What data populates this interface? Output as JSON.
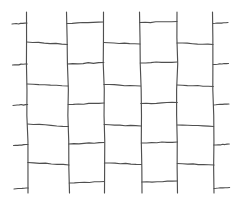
{
  "figure": {
    "width": 239,
    "height": 203,
    "background_color": "#ffffff",
    "ink_color": "#4f4f4f",
    "stroke_width": 1.15,
    "style": "hand-drawn pencil line sketch, no text labels"
  },
  "chart_data": {
    "type": "line",
    "xlabel": "",
    "ylabel": "",
    "xlim": [
      0,
      239
    ],
    "ylim": [
      0,
      203
    ],
    "grid": false,
    "legend": "none",
    "vertical_lines": [
      {
        "id": "v1",
        "x_top": 26.5,
        "x_bottom": 28.0,
        "y_start": 12.0,
        "y_end": 193.0
      },
      {
        "id": "v2",
        "x_top": 66.5,
        "x_bottom": 69.5,
        "y_start": 12.0,
        "y_end": 193.0
      },
      {
        "id": "v3",
        "x_top": 103.5,
        "x_bottom": 104.5,
        "y_start": 12.0,
        "y_end": 193.0
      },
      {
        "id": "v4",
        "x_top": 139.5,
        "x_bottom": 142.0,
        "y_start": 12.0,
        "y_end": 193.0
      },
      {
        "id": "v5",
        "x_top": 177.0,
        "x_bottom": 177.5,
        "y_start": 12.0,
        "y_end": 193.0
      },
      {
        "id": "v6",
        "x_top": 212.5,
        "x_bottom": 214.0,
        "y_start": 12.0,
        "y_end": 193.0
      }
    ],
    "horizontal_rungs": [
      {
        "id": "c1r1",
        "column": 1,
        "phase": "odd",
        "x_start": 26.8,
        "y_start": 42.0,
        "x_end": 67.5,
        "y_end": 44.5
      },
      {
        "id": "c1r2",
        "column": 1,
        "phase": "odd",
        "x_start": 27.2,
        "y_start": 84.0,
        "x_end": 68.0,
        "y_end": 86.0
      },
      {
        "id": "c1r3",
        "column": 1,
        "phase": "odd",
        "x_start": 27.5,
        "y_start": 124.0,
        "x_end": 68.5,
        "y_end": 126.5
      },
      {
        "id": "c1r4",
        "column": 1,
        "phase": "odd",
        "x_start": 27.8,
        "y_start": 162.5,
        "x_end": 69.0,
        "y_end": 165.0
      },
      {
        "id": "c2r1",
        "column": 2,
        "phase": "even",
        "x_start": 67.0,
        "y_start": 23.5,
        "x_end": 103.5,
        "y_end": 22.0
      },
      {
        "id": "c2r2",
        "column": 2,
        "phase": "even",
        "x_start": 67.5,
        "y_start": 64.0,
        "x_end": 103.8,
        "y_end": 62.5
      },
      {
        "id": "c2r3",
        "column": 2,
        "phase": "even",
        "x_start": 68.2,
        "y_start": 104.5,
        "x_end": 104.0,
        "y_end": 103.0
      },
      {
        "id": "c2r4",
        "column": 2,
        "phase": "even",
        "x_start": 68.8,
        "y_start": 144.0,
        "x_end": 104.2,
        "y_end": 142.5
      },
      {
        "id": "c2r5",
        "column": 2,
        "phase": "even",
        "x_start": 69.3,
        "y_start": 183.0,
        "x_end": 104.5,
        "y_end": 181.5
      },
      {
        "id": "c3r1",
        "column": 3,
        "phase": "odd",
        "x_start": 103.6,
        "y_start": 42.5,
        "x_end": 140.0,
        "y_end": 44.0
      },
      {
        "id": "c3r2",
        "column": 3,
        "phase": "odd",
        "x_start": 103.9,
        "y_start": 84.5,
        "x_end": 140.5,
        "y_end": 86.0
      },
      {
        "id": "c3r3",
        "column": 3,
        "phase": "odd",
        "x_start": 104.1,
        "y_start": 124.5,
        "x_end": 141.0,
        "y_end": 126.0
      },
      {
        "id": "c3r4",
        "column": 3,
        "phase": "odd",
        "x_start": 104.4,
        "y_start": 163.0,
        "x_end": 141.5,
        "y_end": 164.5
      },
      {
        "id": "c4r1",
        "column": 4,
        "phase": "even",
        "x_start": 139.8,
        "y_start": 22.5,
        "x_end": 177.0,
        "y_end": 21.5
      },
      {
        "id": "c4r2",
        "column": 4,
        "phase": "even",
        "x_start": 140.3,
        "y_start": 63.0,
        "x_end": 177.2,
        "y_end": 62.0
      },
      {
        "id": "c4r3",
        "column": 4,
        "phase": "even",
        "x_start": 140.8,
        "y_start": 103.5,
        "x_end": 177.3,
        "y_end": 102.5
      },
      {
        "id": "c4r4",
        "column": 4,
        "phase": "even",
        "x_start": 141.3,
        "y_start": 143.0,
        "x_end": 177.4,
        "y_end": 142.0
      },
      {
        "id": "c4r5",
        "column": 4,
        "phase": "even",
        "x_start": 141.8,
        "y_start": 182.0,
        "x_end": 177.5,
        "y_end": 181.0
      },
      {
        "id": "c5r1",
        "column": 5,
        "phase": "odd",
        "x_start": 177.0,
        "y_start": 43.0,
        "x_end": 213.0,
        "y_end": 44.5
      },
      {
        "id": "c5r2",
        "column": 5,
        "phase": "odd",
        "x_start": 177.1,
        "y_start": 85.0,
        "x_end": 213.3,
        "y_end": 86.5
      },
      {
        "id": "c5r3",
        "column": 5,
        "phase": "odd",
        "x_start": 177.2,
        "y_start": 125.0,
        "x_end": 213.6,
        "y_end": 126.5
      },
      {
        "id": "c5r4",
        "column": 5,
        "phase": "odd",
        "x_start": 177.3,
        "y_start": 163.5,
        "x_end": 214.0,
        "y_end": 165.0
      }
    ],
    "edge_stubs_left": [
      {
        "id": "ls1",
        "x_start": 12.0,
        "y_start": 24.0,
        "x_end": 27.0,
        "y_end": 23.0
      },
      {
        "id": "ls2",
        "x_start": 12.5,
        "y_start": 65.0,
        "x_end": 27.3,
        "y_end": 64.0
      },
      {
        "id": "ls3",
        "x_start": 13.0,
        "y_start": 105.5,
        "x_end": 27.6,
        "y_end": 104.5
      },
      {
        "id": "ls4",
        "x_start": 13.5,
        "y_start": 145.5,
        "x_end": 27.9,
        "y_end": 144.5
      },
      {
        "id": "ls5",
        "x_start": 14.0,
        "y_start": 189.0,
        "x_end": 28.2,
        "y_end": 188.0
      }
    ],
    "edge_stubs_right": [
      {
        "id": "rs1",
        "x_start": 213.0,
        "y_start": 23.5,
        "x_end": 228.0,
        "y_end": 22.5
      },
      {
        "id": "rs2",
        "x_start": 213.2,
        "y_start": 64.5,
        "x_end": 228.5,
        "y_end": 63.5
      },
      {
        "id": "rs3",
        "x_start": 213.5,
        "y_start": 105.0,
        "x_end": 229.0,
        "y_end": 104.0
      },
      {
        "id": "rs4",
        "x_start": 213.7,
        "y_start": 145.0,
        "x_end": 229.3,
        "y_end": 144.0
      },
      {
        "id": "rs5",
        "x_start": 214.0,
        "y_start": 188.5,
        "x_end": 229.6,
        "y_end": 187.5
      }
    ]
  }
}
